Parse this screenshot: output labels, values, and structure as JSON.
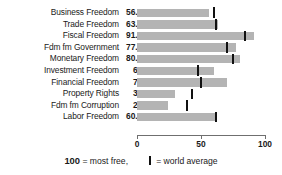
{
  "title_sliver": "FREEDOM FROM GOVERNMENT INDEX",
  "chart_data": {
    "type": "bar",
    "title": "",
    "xlabel": "",
    "ylabel": "",
    "orientation": "horizontal",
    "xlim": [
      0,
      100
    ],
    "xticks": [
      0,
      50,
      100
    ],
    "xticklabels": [
      "0",
      "50",
      "100"
    ],
    "grid": false,
    "bar_color": "#b4b4b4",
    "marker_color": "#111111",
    "categories": [
      "Business Freedom",
      "Trade Freedom",
      "Fiscal Freedom",
      "Fdm fm Government",
      "Monetary Freedom",
      "Investment Freedom",
      "Financial Freedom",
      "Property Rights",
      "Fdm fm Corruption",
      "Labor Freedom"
    ],
    "values": [
      56.1,
      63.2,
      91.5,
      77.7,
      80.7,
      60,
      70,
      30,
      24,
      60.6
    ],
    "value_labels": [
      "56.1",
      "63.2",
      "91.5",
      "77.7",
      "80.7",
      "60",
      "70",
      "30",
      "24",
      "60.6"
    ],
    "series": [
      {
        "name": "Country score",
        "values": [
          56.1,
          63.2,
          91.5,
          77.7,
          80.7,
          60,
          70,
          30,
          24,
          60.6
        ]
      },
      {
        "name": "World average",
        "values": [
          60,
          62,
          84,
          70,
          75,
          48,
          50,
          43,
          39,
          62
        ]
      }
    ],
    "legend": {
      "position": "bottom",
      "entries": [
        {
          "symbol": "100",
          "text": "= most free,"
        },
        {
          "symbol": "|",
          "text": "= world average"
        }
      ]
    }
  },
  "legend": {
    "score_value": "100",
    "score_text": "= most free,",
    "marker_text": "= world average"
  }
}
